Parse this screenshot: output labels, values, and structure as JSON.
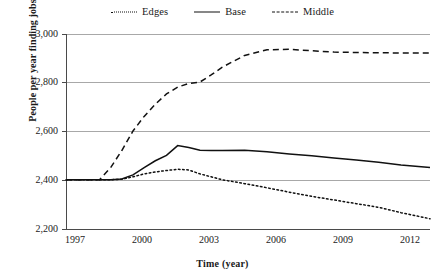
{
  "chart_data": {
    "type": "line",
    "title": "",
    "xlabel": "Time (year)",
    "ylabel": "People per year finding jobs",
    "xlim": [
      1997,
      2013.3
    ],
    "ylim": [
      2200,
      3000
    ],
    "xticks": [
      "1997",
      "2000",
      "2003",
      "2006",
      "2009",
      "2012"
    ],
    "xtick_values": [
      1997,
      2000,
      2003,
      2006,
      2009,
      2012
    ],
    "yticks": [
      "2,200",
      "2,400",
      "2,600",
      "2,800",
      "3,000"
    ],
    "ytick_values": [
      2200,
      2400,
      2600,
      2800,
      3000
    ],
    "grid": "horizontal",
    "legend_position": "top-center",
    "x": [
      1997,
      1998,
      1998.5,
      1999,
      1999.5,
      2000,
      2000.5,
      2001,
      2001.5,
      2002,
      2002.5,
      2003,
      2003.5,
      2004,
      2005,
      2006,
      2007,
      2008,
      2009,
      2010,
      2011,
      2012,
      2013.3
    ],
    "series": [
      {
        "name": "Edges",
        "style": "dotted",
        "color": "#111111",
        "values": [
          2400,
          2400,
          2400,
          2400,
          2402,
          2412,
          2424,
          2432,
          2438,
          2443,
          2440,
          2424,
          2412,
          2400,
          2384,
          2367,
          2349,
          2332,
          2317,
          2302,
          2287,
          2265,
          2240
        ]
      },
      {
        "name": "Base",
        "style": "solid",
        "color": "#111111",
        "values": [
          2400,
          2400,
          2400,
          2400,
          2403,
          2420,
          2450,
          2478,
          2500,
          2540,
          2532,
          2521,
          2520,
          2520,
          2521,
          2515,
          2506,
          2498,
          2489,
          2481,
          2472,
          2461,
          2450
        ]
      },
      {
        "name": "Middle",
        "style": "dashed",
        "color": "#111111",
        "values": [
          2400,
          2400,
          2400,
          2450,
          2520,
          2600,
          2660,
          2710,
          2752,
          2780,
          2795,
          2801,
          2830,
          2862,
          2910,
          2933,
          2935,
          2929,
          2924,
          2922,
          2921,
          2920,
          2920
        ]
      }
    ]
  },
  "legend": {
    "items": [
      {
        "label": "Edges",
        "style": "dotted"
      },
      {
        "label": "Base",
        "style": "solid"
      },
      {
        "label": "Middle",
        "style": "dashed"
      }
    ]
  },
  "axes": {
    "y_title": "People per year finding jobs",
    "x_title": "Time (year)"
  }
}
